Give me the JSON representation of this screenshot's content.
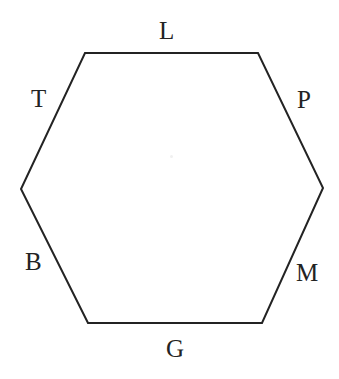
{
  "figure": {
    "type": "hexagon-diagram",
    "background_color": "#ffffff",
    "stroke_color": "#232323",
    "stroke_width": 2,
    "text_color": "#232323",
    "shape": {
      "name": "hexagon",
      "sides": 6,
      "vertices": [
        {
          "id": "top-left",
          "x": 85,
          "y": 53
        },
        {
          "id": "top-right",
          "x": 258,
          "y": 53
        },
        {
          "id": "right",
          "x": 323,
          "y": 188
        },
        {
          "id": "bottom-right",
          "x": 262,
          "y": 323
        },
        {
          "id": "bottom-left",
          "x": 88,
          "y": 323
        },
        {
          "id": "left",
          "x": 21,
          "y": 189
        }
      ]
    },
    "labels": [
      {
        "id": "top",
        "text": "L",
        "side": "top"
      },
      {
        "id": "upper-left",
        "text": "T",
        "side": "upper-left"
      },
      {
        "id": "upper-right",
        "text": "P",
        "side": "upper-right"
      },
      {
        "id": "lower-left",
        "text": "B",
        "side": "lower-left"
      },
      {
        "id": "lower-right",
        "text": "M",
        "side": "lower-right"
      },
      {
        "id": "bottom",
        "text": "G",
        "side": "bottom"
      }
    ]
  }
}
